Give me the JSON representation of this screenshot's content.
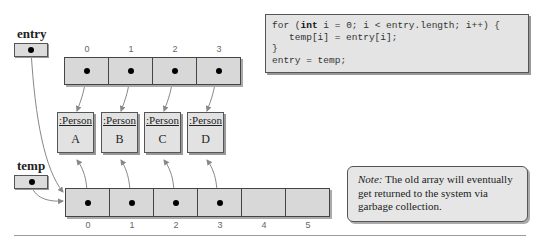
{
  "code": {
    "lines": [
      {
        "kw_prefix": "for (",
        "kw": "int",
        "rest": " i = 0; i < entry.length; i++) {"
      },
      {
        "text": "   temp[i] = entry[i];"
      },
      {
        "text": "}"
      },
      {
        "text": "entry = temp;"
      }
    ]
  },
  "variables": {
    "entry": {
      "label": "entry"
    },
    "temp": {
      "label": "temp"
    }
  },
  "entry_array": {
    "indices": [
      "0",
      "1",
      "2",
      "3"
    ]
  },
  "temp_array": {
    "indices": [
      "0",
      "1",
      "2",
      "3",
      "4",
      "5"
    ]
  },
  "persons": [
    {
      "class": ":Person",
      "name": "A"
    },
    {
      "class": ":Person",
      "name": "B"
    },
    {
      "class": ":Person",
      "name": "C"
    },
    {
      "class": ":Person",
      "name": "D"
    }
  ],
  "note": {
    "prefix": "Note:",
    "text": " The old array will eventually get returned to the system via garbage collection."
  }
}
